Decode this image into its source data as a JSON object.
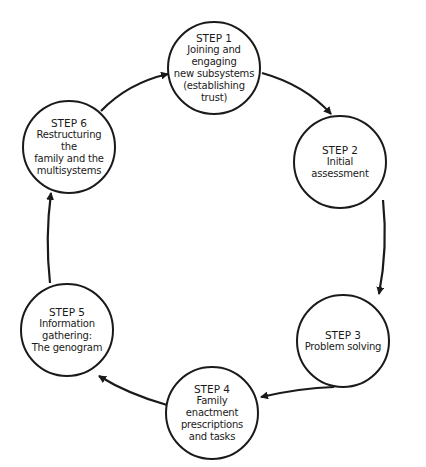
{
  "diagram": {
    "type": "cycle",
    "colors": {
      "stroke": "#1a1a1a",
      "background": "#ffffff",
      "text": "#1a1a1a"
    },
    "steps": [
      {
        "title": "STEP 1",
        "desc": "Joining and\nengaging\nnew subsystems\n(establishing\ntrust)"
      },
      {
        "title": "STEP 2",
        "desc": "Initial assessment"
      },
      {
        "title": "STEP 3",
        "desc": "Problem solving"
      },
      {
        "title": "STEP 4",
        "desc": "Family enactment\nprescriptions\nand tasks"
      },
      {
        "title": "STEP 5",
        "desc": "Information\ngathering:\nThe genogram"
      },
      {
        "title": "STEP 6",
        "desc": "Restructuring the\nfamily and the\nmultisystems"
      }
    ],
    "arrows": [
      {
        "from": "STEP 1",
        "to": "STEP 2"
      },
      {
        "from": "STEP 2",
        "to": "STEP 3"
      },
      {
        "from": "STEP 3",
        "to": "STEP 4"
      },
      {
        "from": "STEP 4",
        "to": "STEP 5"
      },
      {
        "from": "STEP 5",
        "to": "STEP 6"
      },
      {
        "from": "STEP 6",
        "to": "STEP 1"
      }
    ]
  }
}
